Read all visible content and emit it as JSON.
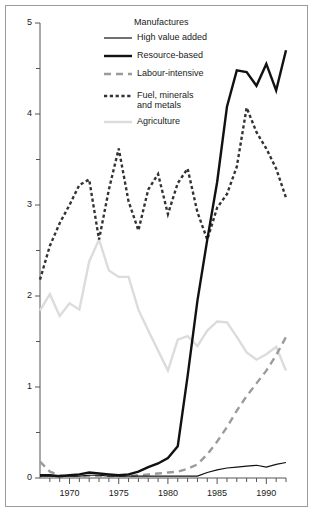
{
  "chart_data": {
    "type": "line",
    "title": "",
    "xlabel": "",
    "ylabel": "",
    "xlim": [
      1967,
      1992
    ],
    "ylim": [
      0,
      5
    ],
    "grid": false,
    "legend_position": "top-center",
    "legend_title": "Manufactures",
    "y_ticks": [
      0,
      1,
      2,
      3,
      4,
      5
    ],
    "y_tick_labels": [
      "0",
      "1",
      "2",
      "3",
      "4",
      "5"
    ],
    "y_minor_ticks": [
      0.5,
      1.5,
      2.5,
      3.5,
      4.5
    ],
    "x_ticks": [
      1970,
      1975,
      1980,
      1985,
      1990
    ],
    "x_tick_labels": [
      "1970",
      "1975",
      "1980",
      "1985",
      "1990"
    ],
    "x_minor_ticks": [
      1968,
      1969,
      1971,
      1972,
      1973,
      1974,
      1976,
      1977,
      1978,
      1979,
      1981,
      1982,
      1983,
      1984,
      1986,
      1987,
      1988,
      1989,
      1991,
      1992
    ],
    "x": [
      1967,
      1968,
      1969,
      1970,
      1971,
      1972,
      1973,
      1974,
      1975,
      1976,
      1977,
      1978,
      1979,
      1980,
      1981,
      1982,
      1983,
      1984,
      1985,
      1986,
      1987,
      1988,
      1989,
      1990,
      1991,
      1992
    ],
    "series": [
      {
        "name": "High value added",
        "style": "solid-thin",
        "color": "#111111",
        "values": [
          0.02,
          0.02,
          0.02,
          0.02,
          0.02,
          0.03,
          0.03,
          0.02,
          0.02,
          0.02,
          0.02,
          0.02,
          0.02,
          0.02,
          0.02,
          0.02,
          0.02,
          0.06,
          0.09,
          0.11,
          0.12,
          0.13,
          0.14,
          0.12,
          0.15,
          0.17
        ]
      },
      {
        "name": "Resource-based",
        "style": "solid-thick",
        "color": "#111111",
        "values": [
          0.03,
          0.03,
          0.02,
          0.03,
          0.04,
          0.06,
          0.05,
          0.04,
          0.03,
          0.04,
          0.07,
          0.12,
          0.16,
          0.22,
          0.35,
          1.12,
          1.95,
          2.62,
          3.25,
          4.08,
          4.48,
          4.46,
          4.31,
          4.55,
          4.26,
          4.7
        ]
      },
      {
        "name": "Labour-intensive",
        "style": "dashed",
        "color": "#9b9b9b",
        "values": [
          0.18,
          0.07,
          0.03,
          0.02,
          0.02,
          0.02,
          0.02,
          0.02,
          0.02,
          0.02,
          0.03,
          0.04,
          0.05,
          0.06,
          0.07,
          0.1,
          0.15,
          0.26,
          0.4,
          0.56,
          0.74,
          0.9,
          1.04,
          1.18,
          1.35,
          1.55
        ]
      },
      {
        "name": "Fuel, minerals\nand metals",
        "style": "dotted",
        "color": "#333333",
        "values": [
          2.18,
          2.55,
          2.8,
          3.0,
          3.22,
          3.28,
          2.62,
          3.17,
          3.62,
          3.04,
          2.72,
          3.17,
          3.34,
          2.9,
          3.24,
          3.4,
          2.92,
          2.62,
          2.97,
          3.12,
          3.42,
          4.07,
          3.8,
          3.62,
          3.4,
          3.08
        ]
      },
      {
        "name": "Agriculture",
        "style": "solid-light",
        "color": "#dcdcdc",
        "values": [
          1.84,
          2.02,
          1.78,
          1.92,
          1.85,
          2.38,
          2.62,
          2.28,
          2.21,
          2.21,
          1.85,
          1.62,
          1.4,
          1.18,
          1.52,
          1.56,
          1.45,
          1.62,
          1.72,
          1.71,
          1.55,
          1.38,
          1.3,
          1.36,
          1.44,
          1.18
        ]
      }
    ]
  },
  "axes": {
    "y_labels": [
      "5",
      "4",
      "3",
      "2",
      "1",
      "0"
    ],
    "x_labels": [
      "1970",
      "1975",
      "1980",
      "1985",
      "1990"
    ]
  },
  "legend": {
    "title": "Manufactures",
    "items": [
      {
        "label": "High value added",
        "style": "solid-thin"
      },
      {
        "label": "Resource-based",
        "style": "solid-thick"
      },
      {
        "label": "Labour-intensive",
        "style": "dashed"
      },
      {
        "label": "Fuel, minerals\nand metals",
        "style": "dotted"
      },
      {
        "label": "Agriculture",
        "style": "solid-light"
      }
    ]
  }
}
